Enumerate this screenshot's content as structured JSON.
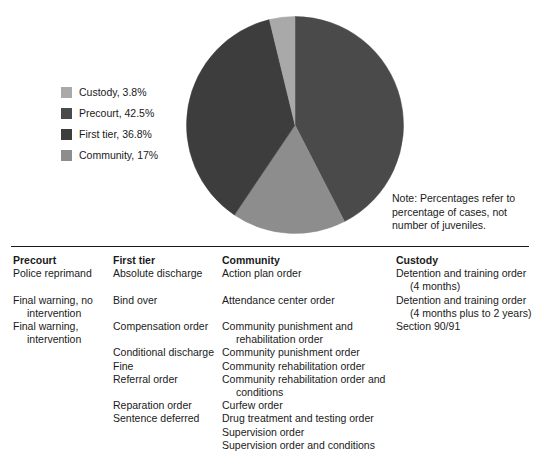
{
  "chart_data": {
    "type": "pie",
    "title": "",
    "categories": [
      "Precourt",
      "Community",
      "First tier",
      "Custody"
    ],
    "values": [
      42.5,
      17,
      36.8,
      3.8
    ],
    "value_unit": "%",
    "start_angle_deg": 0,
    "direction": "clockwise",
    "legend_position": "left",
    "grid": false,
    "slices": [
      {
        "label": "Precourt",
        "value": 42.5,
        "color": "#4a4a4a"
      },
      {
        "label": "Community",
        "value": 17.0,
        "color": "#8d8d8d"
      },
      {
        "label": "First tier",
        "value": 36.8,
        "color": "#3d3d3d"
      },
      {
        "label": "Custody",
        "value": 3.8,
        "color": "#a9a9a9"
      }
    ],
    "note": "Note: Percentages refer to percentage of cases, not number of juveniles."
  },
  "legend": {
    "entries": [
      {
        "label": "Custody, 3.8%",
        "color": "#a9a9a9"
      },
      {
        "label": "Precourt, 42.5%",
        "color": "#4a4a4a"
      },
      {
        "label": "First tier, 36.8%",
        "color": "#3d3d3d"
      },
      {
        "label": "Community, 17%",
        "color": "#8d8d8d"
      }
    ]
  },
  "note": {
    "line1": "Note: Percentages refer to",
    "line2": "percentage of cases, not",
    "line3": "number of juveniles."
  },
  "table": {
    "columns": [
      {
        "header": "Precourt",
        "items": [
          {
            "text": "Police reprimand",
            "gap": false,
            "cont": null
          },
          {
            "text": "Final warning, no",
            "gap": true,
            "cont": "intervention"
          },
          {
            "text": "Final warning,",
            "gap": false,
            "cont": "intervention"
          }
        ]
      },
      {
        "header": "First tier",
        "items": [
          {
            "text": "Absolute discharge",
            "gap": false,
            "cont": null
          },
          {
            "text": "Bind over",
            "gap": true,
            "cont": null
          },
          {
            "text": "Compensation order",
            "gap": true,
            "cont": null
          },
          {
            "text": "Conditional discharge",
            "gap": true,
            "cont": null
          },
          {
            "text": "Fine",
            "gap": false,
            "cont": null
          },
          {
            "text": "Referral order",
            "gap": false,
            "cont": null
          },
          {
            "text": "Reparation order",
            "gap": true,
            "cont": null
          },
          {
            "text": "Sentence deferred",
            "gap": false,
            "cont": null
          }
        ]
      },
      {
        "header": "Community",
        "items": [
          {
            "text": "Action plan order",
            "gap": false,
            "cont": null
          },
          {
            "text": "Attendance center order",
            "gap": true,
            "cont": null
          },
          {
            "text": "Community punishment and",
            "gap": true,
            "cont": "rehabilitation order"
          },
          {
            "text": "Community punishment order",
            "gap": false,
            "cont": null
          },
          {
            "text": "Community rehabilitation order",
            "gap": false,
            "cont": null
          },
          {
            "text": "Community rehabilitation order and",
            "gap": false,
            "cont": "conditions"
          },
          {
            "text": "Curfew order",
            "gap": false,
            "cont": null
          },
          {
            "text": "Drug treatment and testing order",
            "gap": false,
            "cont": null
          },
          {
            "text": "Supervision order",
            "gap": false,
            "cont": null
          },
          {
            "text": "Supervision order and conditions",
            "gap": false,
            "cont": null
          }
        ]
      },
      {
        "header": "Custody",
        "items": [
          {
            "text": "Detention and training order",
            "gap": false,
            "cont": "(4 months)"
          },
          {
            "text": "Detention and training order",
            "gap": false,
            "cont": "(4 months plus to 2 years)"
          },
          {
            "text": "Section 90/91",
            "gap": false,
            "cont": null
          }
        ]
      }
    ]
  }
}
